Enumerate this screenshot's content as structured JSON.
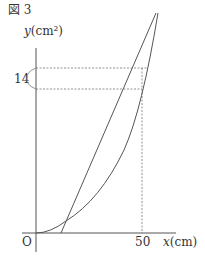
{
  "figure": {
    "title": "図 3",
    "y_axis_label": "y",
    "y_axis_unit": "(cm²)",
    "x_axis_label": "x",
    "x_axis_unit": "(cm)",
    "origin_label": "O",
    "x_tick_label": "50",
    "y_brace_label": "14"
  },
  "colors": {
    "axis": "#555555",
    "curve": "#555555",
    "dotted": "#777777",
    "text": "#333333"
  }
}
